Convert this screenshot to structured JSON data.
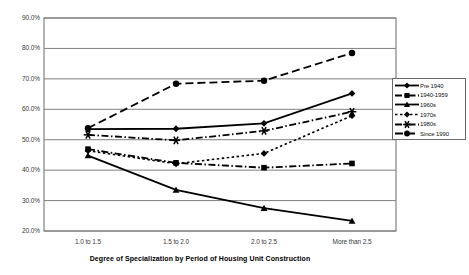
{
  "chart_data": {
    "type": "line",
    "title": "",
    "xlabel": "Degree of Specialization by Period of Housing Unit Construction",
    "ylabel": "",
    "categories": [
      "1.0 to 1.5",
      "1.5 to 2.0",
      "2.0 to 2.5",
      "More than 2.5"
    ],
    "ylim": [
      20,
      90
    ],
    "ytick_labels": [
      "90.0%",
      "80.0%",
      "70.0%",
      "60.0%",
      "50.0%",
      "40.0%",
      "30.0%",
      "20.0%"
    ],
    "ytick_values": [
      90,
      80,
      70,
      60,
      50,
      40,
      30,
      20
    ],
    "grid": true,
    "legend_position": "right",
    "series": [
      {
        "name": "Pre 1940",
        "values": [
          53.5,
          53.6,
          55.4,
          65.2
        ],
        "marker": "diamond",
        "dash": "solid"
      },
      {
        "name": "1940-1959",
        "values": [
          46.9,
          42.4,
          40.8,
          42.2
        ],
        "marker": "square",
        "dash": "dashdot"
      },
      {
        "name": "1960s",
        "values": [
          44.8,
          33.5,
          27.5,
          23.3
        ],
        "marker": "triangle",
        "dash": "solid"
      },
      {
        "name": "1970s",
        "values": [
          46.4,
          42.1,
          45.5,
          57.9
        ],
        "marker": "diamond",
        "dash": "dotted"
      },
      {
        "name": "1980s",
        "values": [
          51.6,
          49.8,
          52.9,
          59.2
        ],
        "marker": "star",
        "dash": "dashdot"
      },
      {
        "name": "Since 1990",
        "values": [
          53.8,
          68.4,
          69.4,
          78.5
        ],
        "marker": "circle",
        "dash": "dashed"
      }
    ]
  },
  "colors": {
    "line": "#000000",
    "grid": "#808080",
    "axis": "#6a6a6a",
    "text": "#3a3a3a"
  }
}
